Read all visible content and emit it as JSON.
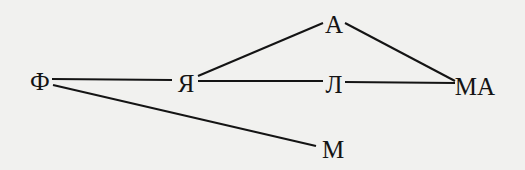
{
  "diagram": {
    "type": "graph",
    "line_color": "#141414",
    "background": "#f1f1ef",
    "nodes": [
      {
        "id": "F",
        "label": "Ф",
        "x": 40,
        "y": 81
      },
      {
        "id": "Ya",
        "label": "Я",
        "x": 186,
        "y": 83
      },
      {
        "id": "A",
        "label": "А",
        "x": 334,
        "y": 24
      },
      {
        "id": "L",
        "label": "Л",
        "x": 334,
        "y": 84
      },
      {
        "id": "MA",
        "label": "МА",
        "x": 475,
        "y": 86
      },
      {
        "id": "M",
        "label": "М",
        "x": 333,
        "y": 149
      }
    ],
    "edges": [
      {
        "from": "F",
        "to": "Ya",
        "x1": 52,
        "y1": 79,
        "x2": 172,
        "y2": 80
      },
      {
        "from": "F",
        "to": "M",
        "x1": 53,
        "y1": 85,
        "x2": 316,
        "y2": 146
      },
      {
        "from": "Ya",
        "to": "A",
        "x1": 198,
        "y1": 76,
        "x2": 323,
        "y2": 23
      },
      {
        "from": "Ya",
        "to": "L",
        "x1": 198,
        "y1": 81,
        "x2": 323,
        "y2": 81
      },
      {
        "from": "L",
        "to": "MA",
        "x1": 345,
        "y1": 82,
        "x2": 455,
        "y2": 83
      },
      {
        "from": "A",
        "to": "MA",
        "x1": 345,
        "y1": 23,
        "x2": 455,
        "y2": 81
      }
    ]
  }
}
